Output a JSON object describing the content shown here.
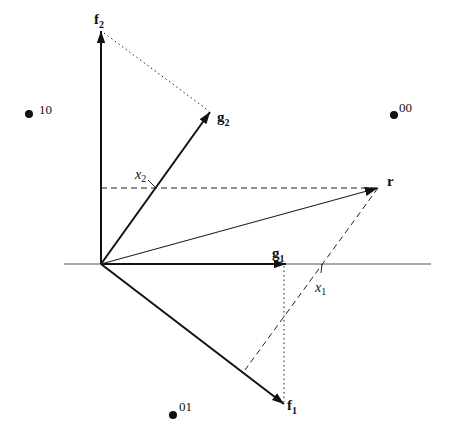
{
  "diagram": {
    "colors": {
      "ink": "#111111",
      "axis": "#555555",
      "background": "#ffffff"
    },
    "vectors": {
      "f1": {
        "label": "f",
        "sub": "1"
      },
      "f2": {
        "label": "f",
        "sub": "2"
      },
      "g1": {
        "label": "g",
        "sub": "1"
      },
      "g2": {
        "label": "g",
        "sub": "2"
      },
      "r": {
        "label": "r"
      }
    },
    "projections": {
      "x1": {
        "label": "x",
        "sub": "1"
      },
      "x2": {
        "label": "x",
        "sub": "2"
      }
    },
    "constellation": [
      {
        "label": "10"
      },
      {
        "label": "00"
      },
      {
        "label": "01"
      }
    ]
  }
}
